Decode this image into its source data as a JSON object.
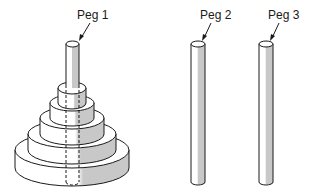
{
  "diagram": {
    "type": "tower-of-hanoi",
    "pegs": [
      {
        "id": 1,
        "label": "Peg 1",
        "disks": 5
      },
      {
        "id": 2,
        "label": "Peg 2",
        "disks": 0
      },
      {
        "id": 3,
        "label": "Peg 3",
        "disks": 0
      }
    ],
    "colors": {
      "stroke": "#1a1a1a",
      "fill": "#ffffff",
      "shade": "#c8c8c8"
    }
  }
}
